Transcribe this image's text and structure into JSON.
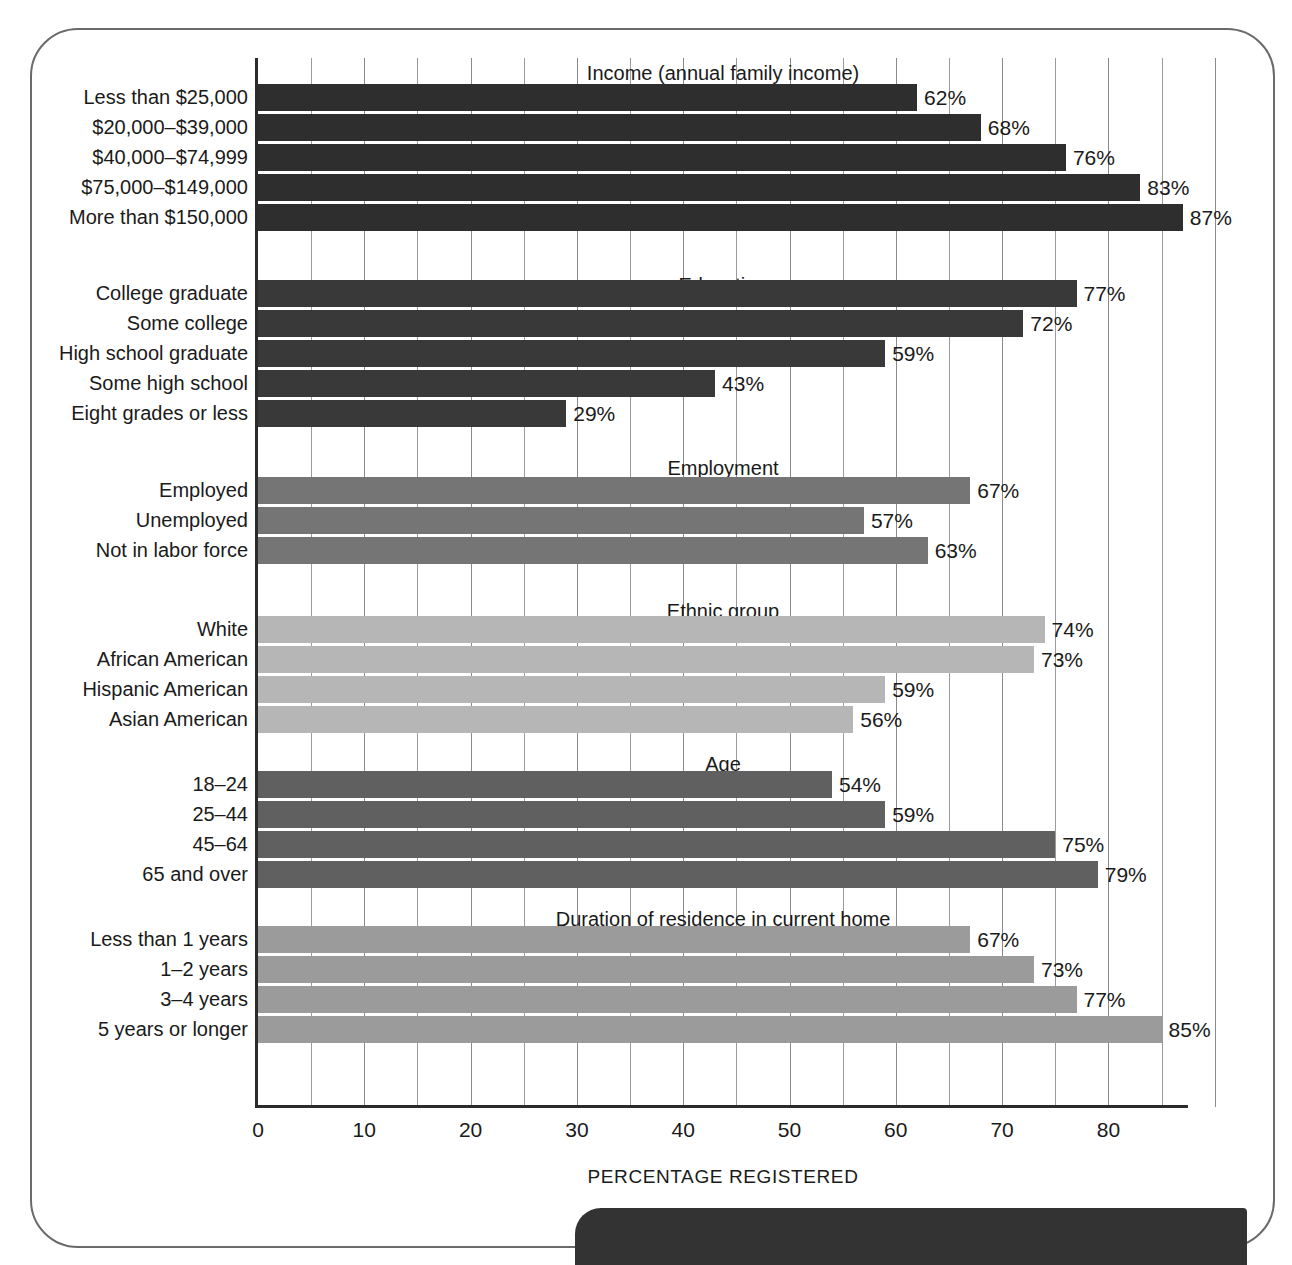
{
  "chart_data": {
    "type": "bar",
    "orientation": "horizontal",
    "title": "",
    "xlabel": "PERCENTAGE REGISTERED",
    "ylabel": "",
    "xlim": [
      0,
      87.5
    ],
    "xticks": [
      0,
      10,
      20,
      30,
      40,
      50,
      60,
      70,
      80
    ],
    "xtick_labels": [
      "0",
      "10",
      "20",
      "30",
      "40",
      "50",
      "60",
      "70",
      "80"
    ],
    "gridline_interval": 5,
    "grid": true,
    "legend": false,
    "value_suffix": "%",
    "groups": [
      {
        "title": "Income (annual family income)",
        "color": "#2e2e2e",
        "categories": [
          "Less than $25,000",
          "$20,000–$39,000",
          "$40,000–$74,999",
          "$75,000–$149,000",
          "More than $150,000"
        ],
        "values": [
          62,
          68,
          76,
          83,
          87
        ],
        "value_labels": [
          "62%",
          "68%",
          "76%",
          "83%",
          "87%"
        ]
      },
      {
        "title": "Education",
        "color": "#393939",
        "categories": [
          "College graduate",
          "Some college",
          "High school graduate",
          "Some high school",
          "Eight grades or less"
        ],
        "values": [
          77,
          72,
          59,
          43,
          29
        ],
        "value_labels": [
          "77%",
          "72%",
          "59%",
          "43%",
          "29%"
        ]
      },
      {
        "title": "Employment",
        "color": "#757575",
        "categories": [
          "Employed",
          "Unemployed",
          "Not in labor force"
        ],
        "values": [
          67,
          57,
          63
        ],
        "value_labels": [
          "67%",
          "57%",
          "63%"
        ]
      },
      {
        "title": "Ethnic group",
        "color": "#b6b6b6",
        "categories": [
          "White",
          "African American",
          "Hispanic American",
          "Asian American"
        ],
        "values": [
          74,
          73,
          59,
          56
        ],
        "value_labels": [
          "74%",
          "73%",
          "59%",
          "56%"
        ]
      },
      {
        "title": "Age",
        "color": "#606060",
        "categories": [
          "18–24",
          "25–44",
          "45–64",
          "65 and over"
        ],
        "values": [
          54,
          59,
          75,
          79
        ],
        "value_labels": [
          "54%",
          "59%",
          "75%",
          "79%"
        ]
      },
      {
        "title": "Duration of residence in current home",
        "color": "#9b9b9b",
        "categories": [
          "Less than 1 years",
          "1–2 years",
          "3–4 years",
          "5 years or longer"
        ],
        "values": [
          67,
          73,
          77,
          85
        ],
        "value_labels": [
          "67%",
          "73%",
          "77%",
          "85%"
        ]
      }
    ]
  },
  "axis": {
    "x_title": "PERCENTAGE REGISTERED"
  }
}
